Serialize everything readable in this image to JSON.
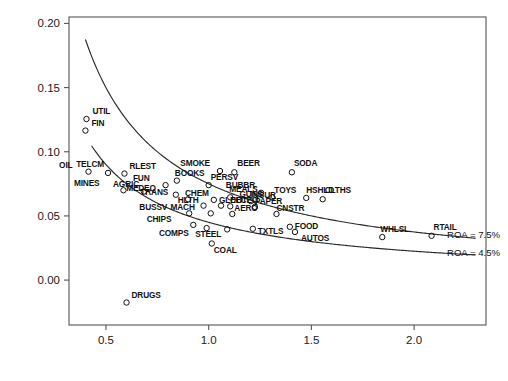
{
  "chart_data": {
    "type": "scatter",
    "title": "",
    "xlabel": "Asset Turnover",
    "ylabel": "Profit Margin",
    "xlim": [
      0.32,
      2.35
    ],
    "ylim": [
      -0.035,
      0.205
    ],
    "xticks": [
      "0.5",
      "1.0",
      "1.5",
      "2.0"
    ],
    "xtick_values": [
      0.5,
      1.0,
      1.5,
      2.0
    ],
    "yticks": [
      "0.00",
      "0.05",
      "0.10",
      "0.15",
      "0.20"
    ],
    "ytick_values": [
      0.0,
      0.05,
      0.1,
      0.15,
      0.2
    ],
    "grid": false,
    "legend_position": "none",
    "marker": "open-circle",
    "annotations": [
      {
        "text": "ROA = 7.5%",
        "x": 2.16,
        "y": 0.0355,
        "curve_roa": 0.075
      },
      {
        "text": "ROA = 4.5%",
        "x": 2.16,
        "y": 0.0215,
        "curve_roa": 0.045
      }
    ],
    "curves": [
      {
        "name": "ROA = 7.5%",
        "roa": 0.075,
        "equation": "ProfitMargin = 0.075 / AssetTurnover",
        "x_start": 0.4,
        "x_end": 2.3
      },
      {
        "name": "ROA = 4.5%",
        "roa": 0.045,
        "equation": "ProfitMargin = 0.045 / AssetTurnover",
        "x_start": 0.43,
        "x_end": 2.3
      }
    ],
    "points": [
      {
        "label": "UTIL",
        "x": 0.405,
        "y": 0.1255,
        "lx": 6,
        "ly": -5
      },
      {
        "label": "FIN",
        "x": 0.4,
        "y": 0.1165,
        "lx": 6,
        "ly": -5
      },
      {
        "label": "OIL",
        "x": 0.415,
        "y": 0.0845,
        "lx": -16,
        "ly": -4
      },
      {
        "label": "TELCM",
        "x": 0.51,
        "y": 0.0835,
        "lx": -4,
        "ly": -6
      },
      {
        "label": "RLEST",
        "x": 0.59,
        "y": 0.083,
        "lx": 5,
        "ly": -5
      },
      {
        "label": "MINES",
        "x": 0.585,
        "y": 0.07,
        "lx": -24,
        "ly": -4
      },
      {
        "label": "AGRIC",
        "x": 0.685,
        "y": 0.069,
        "lx": -5,
        "ly": -5
      },
      {
        "label": "FUN",
        "x": 0.79,
        "y": 0.074,
        "lx": -16,
        "ly": -4
      },
      {
        "label": "BOOKS",
        "x": 0.845,
        "y": 0.0775,
        "lx": -2,
        "ly": -5
      },
      {
        "label": "MEDEQ",
        "x": 0.84,
        "y": 0.0665,
        "lx": -20,
        "ly": -4
      },
      {
        "label": "TRANS",
        "x": 0.9,
        "y": 0.063,
        "lx": -20,
        "ly": -4
      },
      {
        "label": "SMOKE",
        "x": 1.055,
        "y": 0.085,
        "lx": -10,
        "ly": -5
      },
      {
        "label": "BEER",
        "x": 1.125,
        "y": 0.084,
        "lx": 3,
        "ly": -6
      },
      {
        "label": "PERSV",
        "x": 1.0,
        "y": 0.074,
        "lx": 2,
        "ly": -5
      },
      {
        "label": "SODA",
        "x": 1.405,
        "y": 0.084,
        "lx": 2,
        "ly": -6
      },
      {
        "label": "BUBBR",
        "x": 1.255,
        "y": 0.068,
        "lx": -6,
        "ly": -5
      },
      {
        "label": "TOYS",
        "x": 1.31,
        "y": 0.0645,
        "lx": 2,
        "ly": -4
      },
      {
        "label": "HSHLD",
        "x": 1.475,
        "y": 0.064,
        "lx": 0,
        "ly": -5
      },
      {
        "label": "CLTHS",
        "x": 1.555,
        "y": 0.063,
        "lx": 2,
        "ly": -6
      },
      {
        "label": "MEALS",
        "x": 1.105,
        "y": 0.0645,
        "lx": -1,
        "ly": -5
      },
      {
        "label": "CHEM",
        "x": 1.025,
        "y": 0.0625,
        "lx": -5,
        "ly": -4
      },
      {
        "label": "GUNS",
        "x": 1.15,
        "y": 0.0625,
        "lx": 0,
        "ly": -3
      },
      {
        "label": "INSUR",
        "x": 1.205,
        "y": 0.0615,
        "lx": 0,
        "ly": -3
      },
      {
        "label": "HLTH",
        "x": 0.975,
        "y": 0.058,
        "lx": -5,
        "ly": -3
      },
      {
        "label": "GLDBT",
        "x": 1.06,
        "y": 0.058,
        "lx": -2,
        "ly": -3
      },
      {
        "label": "ELCEQ",
        "x": 1.105,
        "y": 0.0575,
        "lx": 0,
        "ly": -3
      },
      {
        "label": "PAPER",
        "x": 1.225,
        "y": 0.057,
        "lx": 0,
        "ly": -3
      },
      {
        "label": "BUSSV",
        "x": 0.905,
        "y": 0.052,
        "lx": -22,
        "ly": -3
      },
      {
        "label": "MACH",
        "x": 1.01,
        "y": 0.052,
        "lx": -16,
        "ly": -3
      },
      {
        "label": "AERO",
        "x": 1.115,
        "y": 0.0515,
        "lx": 2,
        "ly": -3
      },
      {
        "label": "CNSTR",
        "x": 1.33,
        "y": 0.0515,
        "lx": 0,
        "ly": -3
      },
      {
        "label": "CHIPS",
        "x": 0.925,
        "y": 0.043,
        "lx": -22,
        "ly": -3
      },
      {
        "label": "COMPS",
        "x": 0.99,
        "y": 0.0405,
        "lx": -18,
        "ly": 8
      },
      {
        "label": "STEEL",
        "x": 1.09,
        "y": 0.0395,
        "lx": -6,
        "ly": 8
      },
      {
        "label": "TXTLS",
        "x": 1.215,
        "y": 0.04,
        "lx": 5,
        "ly": 5
      },
      {
        "label": "FOOD",
        "x": 1.395,
        "y": 0.0415,
        "lx": 5,
        "ly": 2
      },
      {
        "label": "AUTOS",
        "x": 1.42,
        "y": 0.0375,
        "lx": 6,
        "ly": 9
      },
      {
        "label": "WHLSL",
        "x": 1.845,
        "y": 0.0335,
        "lx": -2,
        "ly": -5
      },
      {
        "label": "RTAIL",
        "x": 2.085,
        "y": 0.0345,
        "lx": 2,
        "ly": -6
      },
      {
        "label": "COAL",
        "x": 1.015,
        "y": 0.0285,
        "lx": 2,
        "ly": 9
      },
      {
        "label": "DRUGS",
        "x": 0.6,
        "y": -0.0175,
        "lx": 5,
        "ly": -5
      }
    ]
  },
  "axes": {
    "x_title": "Asset Turnover",
    "y_title": "Profit Margin"
  }
}
